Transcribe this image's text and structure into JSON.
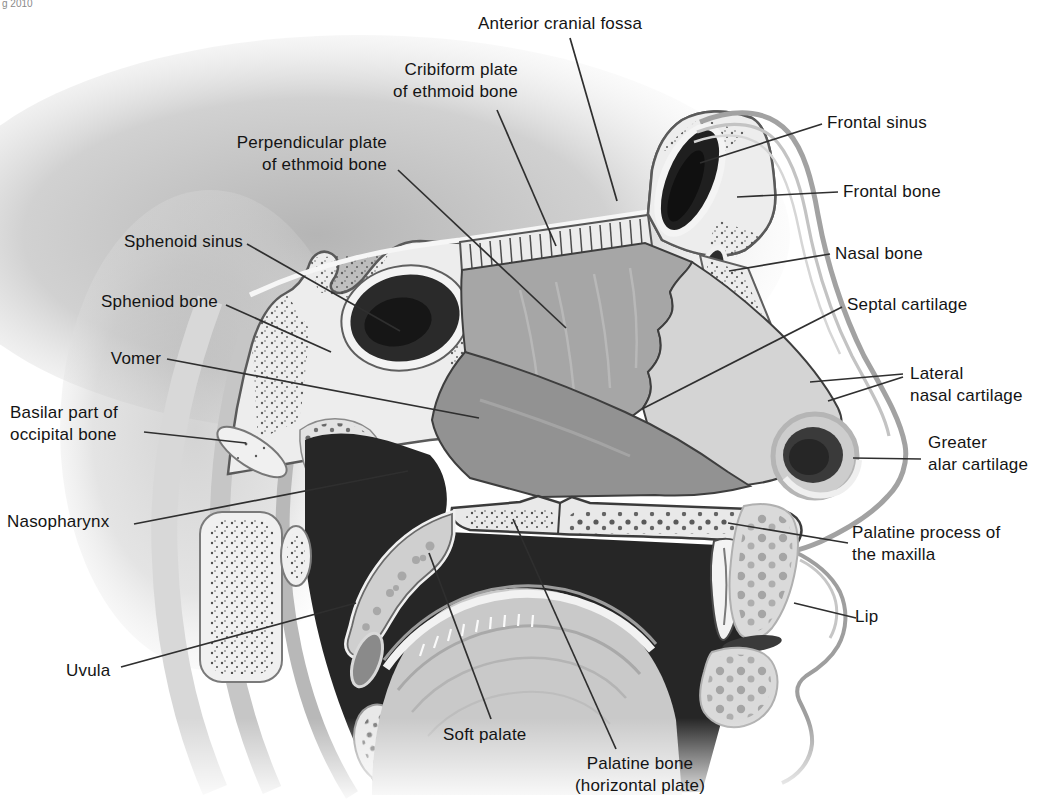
{
  "meta": {
    "corner_mark": "g 2010"
  },
  "palette": {
    "ink": "#141414",
    "leader_line": "#2f2f2f",
    "bone_light": "#ededed",
    "cavity_dark": "#242424",
    "septum_bone": "#a6a6a6",
    "septum_cartilage": "#d4d4d4",
    "vomer_gray": "#929292"
  },
  "labels": [
    {
      "id": "anterior-cranial-fossa",
      "text": "Anterior cranial fossa"
    },
    {
      "id": "cribiform-plate",
      "text": "Cribiform plate\nof ethmoid bone"
    },
    {
      "id": "perpendicular-plate",
      "text": "Perpendicular plate\nof ethmoid bone"
    },
    {
      "id": "frontal-sinus",
      "text": "Frontal sinus"
    },
    {
      "id": "frontal-bone",
      "text": "Frontal bone"
    },
    {
      "id": "nasal-bone",
      "text": "Nasal bone"
    },
    {
      "id": "septal-cartilage",
      "text": "Septal cartilage"
    },
    {
      "id": "sphenoid-sinus",
      "text": "Sphenoid sinus"
    },
    {
      "id": "spheniod-bone",
      "text": "Spheniod bone"
    },
    {
      "id": "vomer",
      "text": "Vomer"
    },
    {
      "id": "basilar-part",
      "text": "Basilar part of\noccipital bone"
    },
    {
      "id": "nasopharynx",
      "text": "Nasopharynx"
    },
    {
      "id": "uvula",
      "text": "Uvula"
    },
    {
      "id": "lateral-nasal-cartilage",
      "text": "Lateral\nnasal cartilage"
    },
    {
      "id": "greater-alar-cartilage",
      "text": "Greater\nalar cartilage"
    },
    {
      "id": "palatine-process",
      "text": "Palatine process of\nthe maxilla"
    },
    {
      "id": "lip",
      "text": "Lip"
    },
    {
      "id": "soft-palate",
      "text": "Soft palate"
    },
    {
      "id": "palatine-bone",
      "text": "Palatine bone\n(horizontal plate)"
    }
  ]
}
